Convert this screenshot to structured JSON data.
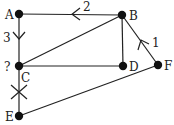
{
  "diagram": {
    "type": "graph",
    "nodes": [
      {
        "id": "A",
        "label": "A",
        "x": 19,
        "y": 14,
        "lx": 6,
        "ly": 19
      },
      {
        "id": "B",
        "label": "B",
        "x": 122,
        "y": 15,
        "lx": 130,
        "ly": 20
      },
      {
        "id": "C",
        "label": "C",
        "x": 19,
        "y": 66,
        "lx": 21,
        "ly": 81
      },
      {
        "id": "D",
        "label": "D",
        "x": 123,
        "y": 66,
        "lx": 130,
        "ly": 71
      },
      {
        "id": "E",
        "label": "E",
        "x": 19,
        "y": 116,
        "lx": 5,
        "ly": 121
      },
      {
        "id": "F",
        "label": "F",
        "x": 158,
        "y": 65,
        "lx": 164,
        "ly": 70
      }
    ],
    "extra_labels": [
      {
        "text": "?",
        "x": 4,
        "y": 70
      }
    ],
    "edges": [
      {
        "from": "A",
        "to": "B",
        "mark": "arrow-left",
        "weight": "2"
      },
      {
        "from": "A",
        "to": "C",
        "mark": "arrow-down",
        "weight": "3"
      },
      {
        "from": "B",
        "to": "C",
        "mark": "none"
      },
      {
        "from": "B",
        "to": "D",
        "mark": "none"
      },
      {
        "from": "C",
        "to": "D",
        "mark": "none"
      },
      {
        "from": "B",
        "to": "F",
        "mark": "arrow-up",
        "weight": "1"
      },
      {
        "from": "C",
        "to": "E",
        "mark": "cross"
      },
      {
        "from": "E",
        "to": "F",
        "mark": "none"
      }
    ],
    "weights": {
      "AB": "2",
      "AC": "3",
      "BF": "1"
    }
  }
}
